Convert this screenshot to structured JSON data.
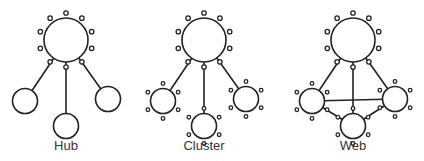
{
  "diagrams": [
    {
      "label": "Hub",
      "type": "hub",
      "center": [
        66,
        40
      ],
      "children_have_satellites": false
    },
    {
      "label": "Cluster",
      "type": "cluster",
      "center": [
        204,
        40
      ],
      "children_have_satellites": true
    },
    {
      "label": "Web",
      "type": "web",
      "center": [
        353,
        40
      ],
      "children_have_satellites": true
    }
  ],
  "colors": {
    "stroke": "#222222",
    "background": "#ffffff",
    "text": "#333333"
  }
}
